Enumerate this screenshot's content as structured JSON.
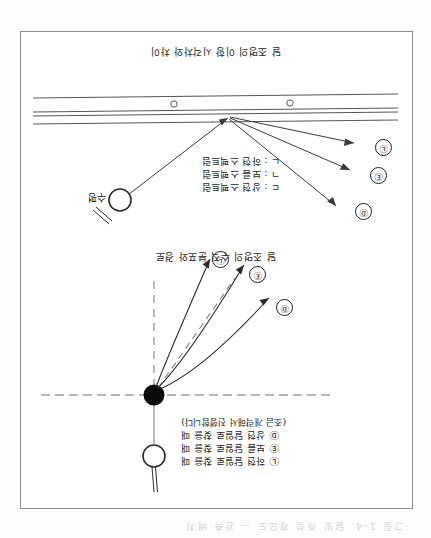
{
  "page": {
    "orientation": "rotated-180",
    "cut_off_text": "그림 1-4. 달빛 측정 개요도 — 관측 배치",
    "ink_color": "#1d1d1d",
    "frame_color": "#8d8d90",
    "paper_color": "#fdfdfc"
  },
  "figure_top": {
    "caption": "달 조명의 수직 분포와 경로",
    "legend": [
      "Ⓛ 하현 달일로 찾을 때",
      "Ⓔ 보름 달일로 찾을 때",
      "Ⓓ 상현 달일로 찾을 때",
      "(조금 개략해서 진행합니다)"
    ],
    "moon_label": "",
    "ray_labels": [
      "Ⓓ",
      "Ⓔ",
      "Ⓛ"
    ],
    "dashed_lines": [
      "horizontal-reference",
      "vertical-reference",
      "mid-ray-reference"
    ]
  },
  "figure_bottom": {
    "caption": "달 조명의 이항 시각차와 차이",
    "legend": [
      "ㄷ : 상현 스펙트럼",
      "ㄱ : 보름 스펙트럼",
      "ㄴ : 하현 스펙트럼"
    ],
    "moon_label": "수평",
    "ray_labels": [
      "Ⓓ",
      "Ⓔ",
      "Ⓛ"
    ],
    "surface": {
      "bands": 4,
      "inclusions": 2
    }
  }
}
